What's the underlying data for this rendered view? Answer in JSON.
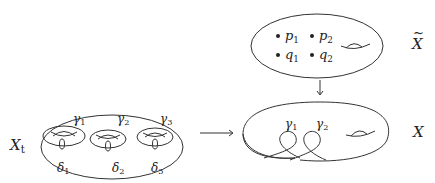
{
  "diagram": {
    "type": "commutative-diagram",
    "nodes": {
      "X_tilde": {
        "label": "X",
        "decoration": "tilde",
        "points": [
          {
            "name": "p",
            "sub": "1"
          },
          {
            "name": "p",
            "sub": "2"
          },
          {
            "name": "q",
            "sub": "1"
          },
          {
            "name": "q",
            "sub": "2"
          }
        ],
        "handles": 1
      },
      "X_t": {
        "label": "X",
        "sub": "t",
        "handles": 3,
        "gamma_labels": [
          {
            "name": "γ",
            "sub": "1"
          },
          {
            "name": "γ",
            "sub": "2"
          },
          {
            "name": "γ",
            "sub": "3"
          }
        ],
        "delta_labels": [
          {
            "name": "δ",
            "sub": "1"
          },
          {
            "name": "δ",
            "sub": "2"
          },
          {
            "name": "δ",
            "sub": "3"
          }
        ]
      },
      "X": {
        "label": "X",
        "nodes": 2,
        "gamma_labels": [
          {
            "name": "γ",
            "sub": "1"
          },
          {
            "name": "γ",
            "sub": "2"
          }
        ],
        "handles": 1
      }
    },
    "edges": [
      {
        "from": "X_t",
        "to": "X",
        "direction": "right"
      },
      {
        "from": "X_tilde",
        "to": "X",
        "direction": "down"
      }
    ]
  }
}
